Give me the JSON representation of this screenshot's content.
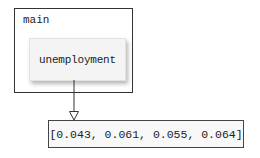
{
  "diagram": {
    "frame": {
      "label": "main"
    },
    "variable": {
      "name": "unemployment"
    },
    "value": {
      "text": "[0.043, 0.061, 0.055, 0.064]",
      "items": [
        0.043,
        0.061,
        0.055,
        0.064
      ]
    },
    "colors": {
      "line": "#333333",
      "var_box_bg": "#f4f4f4",
      "value_box_bg": "#f8f8f8"
    }
  }
}
